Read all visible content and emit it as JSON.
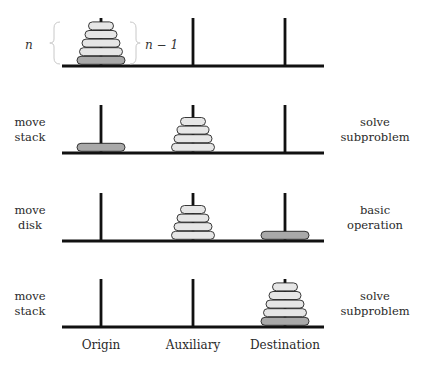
{
  "diagram": {
    "colors": {
      "line": "#111111",
      "disk_light": "#e6e6e6",
      "disk_dark": "#a9a9a9",
      "disk_outline": "#222222",
      "brace": "#c8c8c8"
    },
    "pegs": {
      "x": [
        101,
        193,
        285
      ],
      "base_x_start": 62,
      "base_x_end": 324
    },
    "columns": [
      {
        "label": "Origin"
      },
      {
        "label": "Auxiliary"
      },
      {
        "label": "Destination"
      }
    ],
    "annotations": {
      "n_label": "n",
      "n_minus_1_label": "n − 1"
    },
    "rows": [
      {
        "left_label": "",
        "right_label": "",
        "base_y": 66,
        "stacks": [
          {
            "peg": 0,
            "disks": [
              "dark",
              "light",
              "light",
              "light",
              "light"
            ]
          },
          {
            "peg": 1,
            "disks": []
          },
          {
            "peg": 2,
            "disks": []
          }
        ]
      },
      {
        "left_label": [
          "move",
          "stack"
        ],
        "right_label": [
          "solve",
          "subproblem"
        ],
        "base_y": 153,
        "stacks": [
          {
            "peg": 0,
            "disks": [
              "dark"
            ]
          },
          {
            "peg": 1,
            "disks": [
              "light",
              "light",
              "light",
              "light"
            ]
          },
          {
            "peg": 2,
            "disks": []
          }
        ]
      },
      {
        "left_label": [
          "move",
          "disk"
        ],
        "right_label": [
          "basic",
          "operation"
        ],
        "base_y": 241,
        "stacks": [
          {
            "peg": 0,
            "disks": []
          },
          {
            "peg": 1,
            "disks": [
              "light",
              "light",
              "light",
              "light"
            ]
          },
          {
            "peg": 2,
            "disks": [
              "dark"
            ]
          }
        ]
      },
      {
        "left_label": [
          "move",
          "stack"
        ],
        "right_label": [
          "solve",
          "subproblem"
        ],
        "base_y": 327,
        "stacks": [
          {
            "peg": 0,
            "disks": []
          },
          {
            "peg": 1,
            "disks": []
          },
          {
            "peg": 2,
            "disks": [
              "dark",
              "light",
              "light",
              "light",
              "light"
            ]
          }
        ]
      }
    ]
  }
}
